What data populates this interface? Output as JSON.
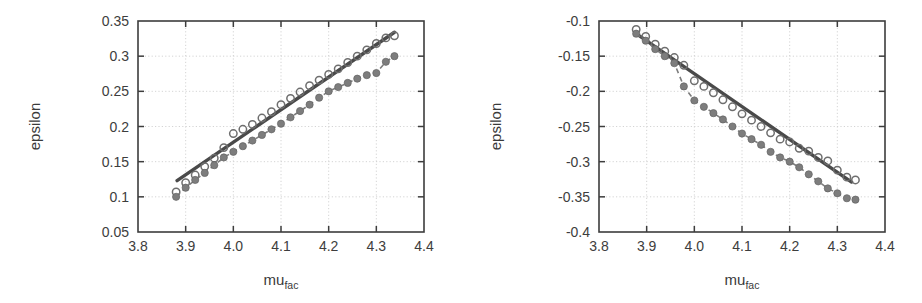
{
  "figure": {
    "background": "#ffffff",
    "ink_color": "#3d3d3d",
    "marker_open_color": "#6e6e6e",
    "marker_filled_color": "#7d7d7d",
    "line_color": "#4a4a4a",
    "grid_color": "#c9c9c9"
  },
  "chart_data": [
    {
      "type": "scatter",
      "panel": "left",
      "title": "",
      "xlabel": "mu_fac",
      "xlabel_base": "mu",
      "xlabel_sub": "fac",
      "ylabel": "epsilon",
      "xlim": [
        3.8,
        4.4
      ],
      "ylim": [
        0.05,
        0.35
      ],
      "xticks": [
        3.8,
        3.9,
        4.0,
        4.1,
        4.2,
        4.3,
        4.4
      ],
      "xtick_labels": [
        "3.8",
        "3.9",
        "4.0",
        "4.1",
        "4.2",
        "4.3",
        "4.4"
      ],
      "yticks": [
        0.05,
        0.1,
        0.15,
        0.2,
        0.25,
        0.3,
        0.35
      ],
      "ytick_labels": [
        "0.05",
        "0.1",
        "0.15",
        "0.2",
        "0.25",
        "0.3",
        "0.35"
      ],
      "grid": true,
      "legend": "none",
      "series": [
        {
          "name": "linear-fit",
          "style": "solid-line",
          "x": [
            3.882,
            4.338
          ],
          "values": [
            0.123,
            0.334
          ]
        },
        {
          "name": "open-circles",
          "style": "open-circle-markers",
          "x": [
            3.88,
            3.9,
            3.92,
            3.94,
            3.96,
            3.98,
            4.0,
            4.02,
            4.04,
            4.06,
            4.08,
            4.1,
            4.12,
            4.14,
            4.16,
            4.18,
            4.2,
            4.22,
            4.24,
            4.26,
            4.28,
            4.3,
            4.32,
            4.338
          ],
          "values": [
            0.107,
            0.12,
            0.131,
            0.143,
            0.155,
            0.17,
            0.19,
            0.196,
            0.203,
            0.212,
            0.221,
            0.231,
            0.24,
            0.249,
            0.258,
            0.266,
            0.274,
            0.282,
            0.291,
            0.3,
            0.309,
            0.318,
            0.326,
            0.329
          ]
        },
        {
          "name": "filled-circles",
          "style": "filled-circle-markers-dashed",
          "x": [
            3.88,
            3.9,
            3.92,
            3.94,
            3.96,
            3.98,
            4.0,
            4.02,
            4.04,
            4.06,
            4.08,
            4.1,
            4.12,
            4.14,
            4.16,
            4.18,
            4.2,
            4.22,
            4.24,
            4.26,
            4.28,
            4.3,
            4.32,
            4.338
          ],
          "values": [
            0.1,
            0.113,
            0.124,
            0.134,
            0.145,
            0.156,
            0.164,
            0.172,
            0.18,
            0.188,
            0.196,
            0.204,
            0.213,
            0.222,
            0.231,
            0.241,
            0.25,
            0.256,
            0.262,
            0.268,
            0.273,
            0.276,
            0.292,
            0.3
          ]
        }
      ]
    },
    {
      "type": "scatter",
      "panel": "right",
      "title": "",
      "xlabel": "mu_fac",
      "xlabel_base": "mu",
      "xlabel_sub": "fac",
      "ylabel": "epsilon",
      "xlim": [
        3.8,
        4.4
      ],
      "ylim": [
        -0.4,
        -0.1
      ],
      "xticks": [
        3.8,
        3.9,
        4.0,
        4.1,
        4.2,
        4.3,
        4.4
      ],
      "xtick_labels": [
        "3.8",
        "3.9",
        "4.0",
        "4.1",
        "4.2",
        "4.3",
        "4.4"
      ],
      "yticks": [
        -0.4,
        -0.35,
        -0.3,
        -0.25,
        -0.2,
        -0.15,
        -0.1
      ],
      "ytick_labels": [
        "-0.4",
        "-0.35",
        "-0.3",
        "-0.25",
        "-0.2",
        "-0.15",
        "-0.1"
      ],
      "grid": true,
      "legend": "none",
      "series": [
        {
          "name": "linear-fit",
          "style": "solid-line",
          "x": [
            3.878,
            4.33
          ],
          "values": [
            -0.118,
            -0.329
          ]
        },
        {
          "name": "open-circles",
          "style": "open-circle-markers",
          "x": [
            3.878,
            3.898,
            3.918,
            3.938,
            3.958,
            3.978,
            4.0,
            4.02,
            4.04,
            4.06,
            4.08,
            4.1,
            4.12,
            4.14,
            4.16,
            4.18,
            4.2,
            4.22,
            4.24,
            4.26,
            4.28,
            4.3,
            4.32,
            4.338
          ],
          "values": [
            -0.112,
            -0.122,
            -0.133,
            -0.143,
            -0.152,
            -0.163,
            -0.185,
            -0.193,
            -0.202,
            -0.212,
            -0.222,
            -0.232,
            -0.241,
            -0.25,
            -0.259,
            -0.268,
            -0.272,
            -0.281,
            -0.285,
            -0.294,
            -0.299,
            -0.312,
            -0.322,
            -0.326
          ]
        },
        {
          "name": "filled-circles",
          "style": "filled-circle-markers-dashed",
          "x": [
            3.878,
            3.898,
            3.918,
            3.938,
            3.958,
            3.978,
            4.0,
            4.02,
            4.04,
            4.06,
            4.08,
            4.1,
            4.12,
            4.14,
            4.16,
            4.18,
            4.2,
            4.22,
            4.24,
            4.26,
            4.28,
            4.3,
            4.32,
            4.338
          ],
          "values": [
            -0.118,
            -0.128,
            -0.14,
            -0.15,
            -0.16,
            -0.193,
            -0.213,
            -0.222,
            -0.231,
            -0.24,
            -0.25,
            -0.26,
            -0.268,
            -0.276,
            -0.286,
            -0.294,
            -0.3,
            -0.308,
            -0.318,
            -0.328,
            -0.338,
            -0.345,
            -0.352,
            -0.354
          ]
        }
      ]
    }
  ]
}
